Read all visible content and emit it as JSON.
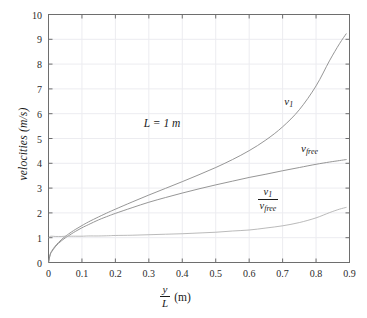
{
  "chart_data": {
    "type": "line",
    "title": "",
    "xlabel": "y/L  (m)",
    "xlabel_parts": {
      "numerator": "y",
      "denominator": "L",
      "unit": "(m)"
    },
    "ylabel": "velocities (m/s)",
    "xlim": [
      0,
      0.9
    ],
    "ylim": [
      0,
      10
    ],
    "grid": true,
    "legend_position": "inline-curve-labels",
    "xticks": [
      "0",
      "0.1",
      "0.2",
      "0.3",
      "0.4",
      "0.5",
      "0.6",
      "0.7",
      "0.8",
      "0.9"
    ],
    "xtick_values": [
      0,
      0.1,
      0.2,
      0.3,
      0.4,
      0.5,
      0.6,
      0.7,
      0.8,
      0.9
    ],
    "yticks": [
      "0",
      "1",
      "2",
      "3",
      "4",
      "5",
      "6",
      "7",
      "8",
      "9",
      "10"
    ],
    "ytick_values": [
      0,
      1,
      2,
      3,
      4,
      5,
      6,
      7,
      8,
      9,
      10
    ],
    "annotations": [
      {
        "text": "L = 1 m",
        "x": 0.285,
        "y": 5.55
      }
    ],
    "x": [
      0,
      0.005,
      0.01,
      0.02,
      0.03,
      0.04,
      0.05,
      0.06,
      0.08,
      0.1,
      0.12,
      0.15,
      0.18,
      0.2,
      0.25,
      0.3,
      0.35,
      0.4,
      0.45,
      0.5,
      0.55,
      0.6,
      0.65,
      0.7,
      0.75,
      0.8,
      0.84,
      0.87,
      0.89
    ],
    "series": [
      {
        "name": "v_1",
        "label_numerator": "v",
        "label_subscript": "1",
        "color": "#8a8a8a",
        "label_x": 0.705,
        "label_y": 6.45,
        "values": [
          0,
          0.33,
          0.47,
          0.66,
          0.81,
          0.94,
          1.05,
          1.15,
          1.33,
          1.49,
          1.64,
          1.84,
          2.03,
          2.15,
          2.44,
          2.72,
          2.99,
          3.26,
          3.54,
          3.83,
          4.15,
          4.51,
          4.94,
          5.47,
          6.16,
          7.12,
          8.13,
          8.82,
          9.22
        ]
      },
      {
        "name": "v_free",
        "label_numerator": "v",
        "label_subscript": "free",
        "color": "#8a8a8a",
        "label_x": 0.755,
        "label_y": 4.52,
        "values": [
          0,
          0.31,
          0.44,
          0.63,
          0.77,
          0.89,
          0.99,
          1.08,
          1.25,
          1.4,
          1.53,
          1.72,
          1.88,
          1.98,
          2.21,
          2.43,
          2.62,
          2.8,
          2.97,
          3.13,
          3.28,
          3.43,
          3.56,
          3.7,
          3.83,
          3.96,
          4.05,
          4.11,
          4.15
        ]
      },
      {
        "name": "v_1/v_free",
        "label_numerator": "v",
        "label_subscript": "1",
        "label_denominator": "v",
        "label_denominator_subscript": "free",
        "color": "#a8a8a8",
        "label_x": 0.625,
        "label_y": 2.62,
        "values": [
          1.0,
          1.05,
          1.06,
          1.05,
          1.05,
          1.05,
          1.06,
          1.06,
          1.06,
          1.06,
          1.07,
          1.07,
          1.08,
          1.09,
          1.1,
          1.12,
          1.14,
          1.16,
          1.19,
          1.22,
          1.27,
          1.31,
          1.39,
          1.48,
          1.61,
          1.8,
          2.01,
          2.15,
          2.22
        ]
      }
    ]
  },
  "colors": {
    "grid": "#ececf0",
    "axis": "#6e6e6e",
    "text": "#1a1a1a",
    "background": "#ffffff"
  }
}
